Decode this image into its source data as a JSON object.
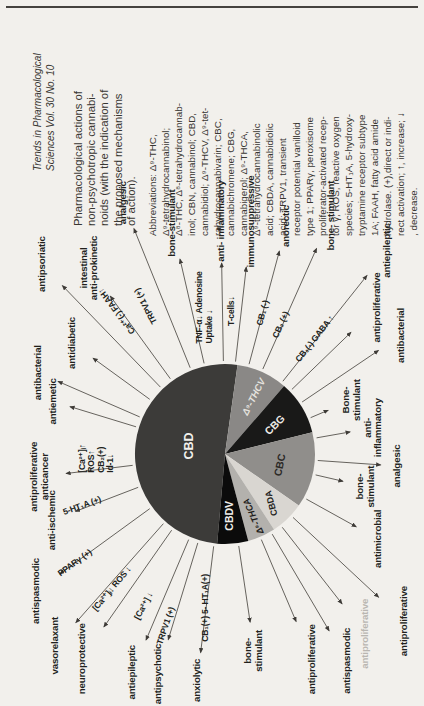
{
  "page": {
    "bg": "#f2f0ec",
    "rule_color": "#45423e"
  },
  "figure": {
    "citation": {
      "lines": [
        "Trends in Pharmacological",
        "Sciences  Vol. 30 No. 10"
      ]
    },
    "caption": {
      "lines": [
        "Pharmacological actions of",
        "non-psychotropic cannabi-",
        "noids (with the indication of",
        "the proposed mechanisms",
        "of action)."
      ]
    },
    "abbreviations": {
      "lines": [
        "Abbreviations: Δ⁹-THC,",
        "Δ⁹-tetrahydrocannabinol;",
        "Δ⁸-THC, Δ⁸-tetrahydrocannab-",
        "inol; CBN, cannabinol; CBD,",
        "cannabidiol; Δ⁹-THCV, Δ⁹-tet-",
        "rahydrocannabivarin; CBC,",
        "cannabichromene; CBG,",
        "cannabigerol; Δ⁹-THCA,",
        "Δ⁹-tetrahydrocannabinolic",
        "acid; CBDA, cannabidiolic",
        "acid; TRPV1, transient",
        "receptor potential vanilloid",
        "type 1; PPARγ, peroxisome",
        "proliferator-activated recep-",
        "tor γ; ROS, reactive oxygen",
        "species; 5-HT₁A, 5-hydroxy-",
        "tryptamine receptor subtype",
        "1A; FAAH, fatty acid amide",
        "hydrolase. (+),direct or indi-",
        "rect activation; ↑, increase; ↓",
        ", decrease."
      ]
    }
  },
  "chart_data": {
    "type": "pie",
    "legend_position": "none",
    "center": {
      "x": 252,
      "y": 225
    },
    "radius": 90,
    "arrow_color": "#56524d",
    "slices": [
      {
        "name": "CBD",
        "start_deg": 275,
        "end_deg": 458,
        "percent": 50.8,
        "color": "#3c3b39",
        "label": {
          "text": "CBD",
          "angle": 13,
          "r": 36,
          "rot": 0,
          "size": 12.5,
          "color": "#f2f0ec",
          "italic": false
        }
      },
      {
        "name": "Δ⁹-THCV",
        "start_deg": 98,
        "end_deg": 131,
        "percent": 9.2,
        "color": "#8a8886",
        "label": {
          "text": "Δ⁹-THCV",
          "angle": 117,
          "r": 64,
          "rot": 27,
          "size": 9.6,
          "color": "#e5e3df",
          "italic": true
        }
      },
      {
        "name": "CBG",
        "start_deg": 131,
        "end_deg": 166,
        "percent": 9.7,
        "color": "#191918",
        "label": {
          "text": "CBG",
          "angle": 150,
          "r": 58,
          "rot": 45,
          "size": 10.5,
          "color": "#edebe7",
          "italic": false
        }
      },
      {
        "name": "CBC",
        "start_deg": 166,
        "end_deg": 215,
        "percent": 13.6,
        "color": "#908e8b",
        "label": {
          "text": "CBC",
          "angle": 191,
          "r": 56,
          "rot": 12,
          "size": 10.5,
          "color": "#2b2926",
          "italic": false
        }
      },
      {
        "name": "CBDA",
        "start_deg": 215,
        "end_deg": 237,
        "percent": 6.1,
        "color": "#d9d6d1",
        "label": {
          "text": "CBDA",
          "angle": 226,
          "r": 68,
          "rot": -15,
          "size": 9.0,
          "color": "#1f1e1c",
          "italic": false
        }
      },
      {
        "name": "Δ⁹-THCA",
        "start_deg": 237,
        "end_deg": 255,
        "percent": 5.0,
        "color": "#b3b1ad",
        "label": {
          "text": "Δ⁹-THCA",
          "angle": 245,
          "r": 68,
          "rot": -24,
          "size": 9.0,
          "color": "#1f1e1c",
          "italic": true
        }
      },
      {
        "name": "CBDV",
        "start_deg": 255,
        "end_deg": 275,
        "percent": 5.6,
        "color": "#0b0b0b",
        "label": {
          "text": "CBDV",
          "angle": 265,
          "r": 62,
          "rot": 0,
          "size": 10.5,
          "color": "#f0eeea",
          "italic": false
        }
      }
    ],
    "action_labels": [
      {
        "group": "CBD",
        "lines": [
          "anxiolytic"
        ],
        "angle": 277,
        "r": 228,
        "arrow_to": 200
      },
      {
        "group": "CBD",
        "lines": [
          "antipsychotic"
        ],
        "angle": 287,
        "r": 230,
        "arrow_to": 194
      },
      {
        "group": "CBD",
        "lines": [
          "antiepileptic"
        ],
        "angle": 293,
        "r": 237,
        "arrow_to": 202
      },
      {
        "group": "CBD",
        "lines": [
          "neuroprotective"
        ],
        "angle": 305,
        "r": 250,
        "arrow_to": 211
      },
      {
        "group": "CBD",
        "lines": [
          "vasorelaxant"
        ],
        "angle": 311.5,
        "r": 256,
        "arrow_to": 225
      },
      {
        "group": "CBD",
        "lines": [
          "antispasmodic"
        ],
        "angle": 324,
        "r": 233,
        "arrow_to": 204
      },
      {
        "group": "CBD",
        "lines": [
          "anti-ischemic"
        ],
        "angle": 339,
        "r": 185,
        "arrow_to": 160
      },
      {
        "group": "CBD",
        "lines": [
          "antiproliferative",
          "anticancer"
        ],
        "angle": 353,
        "r": 186,
        "arrow_to": 160
      },
      {
        "group": "CBD",
        "lines": [
          "antiemetic"
        ],
        "angle": 17,
        "r": 180,
        "arrow_to": 162
      },
      {
        "group": "CBD",
        "lines": [
          "antibacterial"
        ],
        "angle": 23.5,
        "r": 204,
        "arrow_to": 182
      },
      {
        "group": "CBD",
        "lines": [
          "antidiabetic"
        ],
        "angle": 36,
        "r": 189,
        "arrow_to": 163
      },
      {
        "group": "CBD",
        "lines": [
          "antipsoriatic"
        ],
        "angle": 46,
        "r": 264,
        "arrow_to": 234
      },
      {
        "group": "CBD",
        "lines": [
          "intestinal",
          "anti-prokinetic"
        ],
        "angle": 54,
        "r": 230,
        "arrow_to": 195
      },
      {
        "group": "CBD",
        "lines": [
          "analgesic"
        ],
        "angle": 68,
        "r": 271,
        "arrow_to": 243
      },
      {
        "group": "CBD",
        "lines": [
          "bone-stimulant"
        ],
        "angle": 77,
        "r": 237,
        "arrow_to": 200
      },
      {
        "group": "CBD",
        "lines": [
          "anti- inflammatory"
        ],
        "angle": 89,
        "r": 233,
        "arrow_to": 191
      },
      {
        "group": "CBD",
        "lines": [
          "immunosuppressive"
        ],
        "angle": 96.5,
        "r": 234,
        "arrow_to": 188
      },
      {
        "group": "Δ⁹-THCV",
        "lines": [
          "anorectic"
        ],
        "angle": 105,
        "r": 236,
        "arrow_to": 210
      },
      {
        "group": "Δ⁹-THCV",
        "lines": [
          "bone- stimulant"
        ],
        "angle": 114,
        "r": 261,
        "arrow_to": 225
      },
      {
        "group": "Δ⁹-THCV",
        "lines": [
          "antiepileptic"
        ],
        "angle": 128.5,
        "r": 260,
        "arrow_to": 228
      },
      {
        "group": "CBG",
        "lines": [
          "antiproliferative"
        ],
        "angle": 136,
        "r": 211,
        "arrow_to": 175
      },
      {
        "group": "CBG",
        "lines": [
          "antibacterial"
        ],
        "angle": 146,
        "r": 212,
        "arrow_to": 185
      },
      {
        "group": "CBG",
        "lines": [
          "Bone-",
          "stimulant"
        ],
        "angle": 157,
        "r": 138,
        "arrow_to": 112
      },
      {
        "group": "CBC",
        "lines": [
          "anti-",
          "inflammatory"
        ],
        "angle": 170,
        "r": 151,
        "arrow_to": 127
      },
      {
        "group": "CBC",
        "lines": [
          "analgesic"
        ],
        "angle": 184,
        "r": 172,
        "arrow_to": 156
      },
      {
        "group": "CBC",
        "lines": [
          "bone-",
          "stimulant"
        ],
        "angle": 193,
        "r": 145,
        "arrow_to": 121
      },
      {
        "group": "CBC",
        "lines": [
          "antimicrobial"
        ],
        "angle": 209,
        "r": 175,
        "arrow_to": 150
      },
      {
        "group": "CBDA",
        "lines": [
          "antiproliferative"
        ],
        "angle": 223,
        "r": 245,
        "arrow_to": 210
      },
      {
        "group": "CBDA",
        "lines": [
          "antiproliferative"
        ],
        "angle": 232,
        "r": 228,
        "arrow_to": 190,
        "color": "#b9b6b1"
      },
      {
        "group": "Δ⁹-THCA",
        "lines": [
          "antispasmodic"
        ],
        "angle": 239.5,
        "r": 240,
        "arrow_to": 205
      },
      {
        "group": "Δ⁹-THCA",
        "lines": [
          "antiproliferative"
        ],
        "angle": 247,
        "r": 223,
        "arrow_to": 182
      },
      {
        "group": "CBDV",
        "lines": [
          "bone-",
          "stimulant"
        ],
        "angle": 261.5,
        "r": 199,
        "arrow_to": 170
      }
    ],
    "mechanism_labels": [
      {
        "lines": [
          "CB₁(+) 5- HT₁A(+)"
        ],
        "angle": 277,
        "r": 155,
        "rot": 0
      },
      {
        "lines": [
          "TRPV1 (+)"
        ],
        "angle": 289,
        "r": 182,
        "rot": 19
      },
      {
        "lines": [
          "[Ca²⁺] ↓"
        ],
        "angle": 298,
        "r": 172,
        "rot": 28
      },
      {
        "lines": [
          "[Ca²⁺]ᵢ↓  ROS ↓"
        ],
        "angle": 310,
        "r": 176,
        "rot": 40
      },
      {
        "lines": [
          "PPARγ (+)"
        ],
        "angle": 324,
        "r": 185,
        "rot": 54
      },
      {
        "lines": [
          "5-HT₁A (+)"
        ],
        "angle": 340,
        "r": 152,
        "rot": 70
      },
      {
        "lines": [
          "[Ca²⁺]ᵢ↑",
          "ROS↑",
          "CB₂(+)",
          "Id-1↓"
        ],
        "angle": 358,
        "r": 128,
        "rot": 0,
        "stack": true
      },
      {
        "lines": [
          "Ca²⁺(-) FAAH↑"
        ],
        "angle": 53,
        "r": 179,
        "rot": -37
      },
      {
        "lines": [
          "TRPV1 (+)"
        ],
        "angle": 62,
        "r": 168,
        "rot": -28
      },
      {
        "lines": [
          "TNF-α↓ Adenosine",
          "Uptake ↓"
        ],
        "angle": 82,
        "r": 148,
        "rot": 0,
        "stack": true
      },
      {
        "lines": [
          "T-cells↓"
        ],
        "angle": 93,
        "r": 143,
        "rot": 0
      },
      {
        "lines": [
          "CB₁ (-)"
        ],
        "angle": 105,
        "r": 146,
        "rot": 15
      },
      {
        "lines": [
          "CB₂ (+)"
        ],
        "angle": 113.5,
        "r": 141,
        "rot": 24
      },
      {
        "lines": [
          "CB₁(-)  GABA ↑"
        ],
        "angle": 128,
        "r": 146,
        "rot": 38
      }
    ]
  }
}
